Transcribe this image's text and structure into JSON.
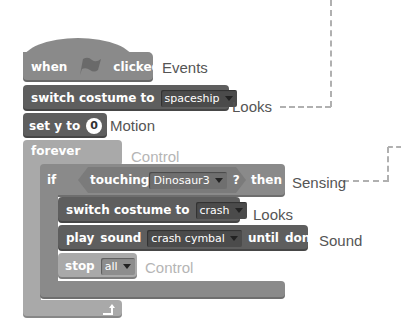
{
  "script": {
    "hat": {
      "when": "when",
      "icon": "green-flag-icon",
      "clicked": "clicked",
      "category": "Events"
    },
    "switch_costume_1": {
      "text": "switch costume to",
      "value": "spaceship",
      "category": "Looks"
    },
    "set_y": {
      "text": "set y to",
      "value": "0",
      "category": "Motion"
    },
    "forever": {
      "text": "forever",
      "category": "Control",
      "loop_icon": "loop-arrow-icon"
    },
    "if_block": {
      "if": "if",
      "then": "then",
      "category": "Sensing",
      "condition": {
        "text": "touching",
        "value": "Dinosaur3",
        "suffix": "?"
      }
    },
    "switch_costume_2": {
      "text": "switch costume to",
      "value": "crash",
      "category": "Looks"
    },
    "play_sound": {
      "play": "play",
      "sound": "sound",
      "value": "crash cymbal",
      "until": "until",
      "done": "done",
      "category": "Sound"
    },
    "stop": {
      "text": "stop",
      "value": "all",
      "category": "Control"
    }
  },
  "colors": {
    "dark_block": "#5e5e5e",
    "mid_block": "#8a8a8a",
    "light_block": "#a9a9a9",
    "label": "#555555",
    "faded_label": "#b5b5b5",
    "dash": "#b0b0b0"
  }
}
